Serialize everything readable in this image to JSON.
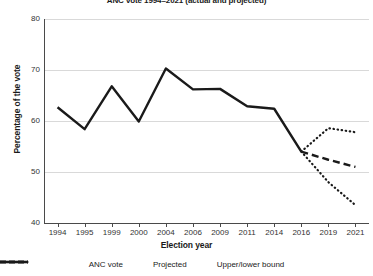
{
  "chart_data": {
    "type": "line",
    "title": "ANC vote 1994–2021 (actual and projected)",
    "xlabel": "Election year",
    "ylabel": "Percentage of the vote",
    "categories": [
      "1994",
      "1995",
      "1999",
      "2000",
      "2004",
      "2006",
      "2009",
      "2011",
      "2014",
      "2016",
      "2019",
      "2021"
    ],
    "ylim": [
      40,
      80
    ],
    "yticks": [
      40,
      50,
      60,
      70,
      80
    ],
    "grid": true,
    "legend_position": "bottom",
    "series": [
      {
        "name": "ANC vote",
        "style": "solid",
        "color": "#1a1a1a",
        "x": [
          "1994",
          "1995",
          "1999",
          "2000",
          "2004",
          "2006",
          "2009",
          "2011",
          "2014",
          "2016"
        ],
        "values": [
          62.7,
          58.4,
          66.8,
          59.9,
          70.3,
          66.2,
          66.3,
          62.9,
          62.4,
          54.0
        ]
      },
      {
        "name": "Projected",
        "style": "dashed",
        "color": "#1a1a1a",
        "x": [
          "2016",
          "2019",
          "2021"
        ],
        "values": [
          54.0,
          52.4,
          51.0
        ]
      },
      {
        "name": "Upper/lower bound",
        "style": "dotted",
        "color": "#1a1a1a",
        "x": [
          "2016",
          "2019",
          "2021"
        ],
        "upper": [
          54.0,
          58.6,
          57.8
        ],
        "lower": [
          54.0,
          48.0,
          43.5
        ]
      }
    ]
  },
  "axis": {
    "y_tick_labels": [
      "80",
      "70",
      "60",
      "50",
      "40"
    ],
    "x_tick_labels": [
      "1994",
      "1995",
      "1999",
      "2000",
      "2004",
      "2006",
      "2009",
      "2011",
      "2014",
      "2016",
      "2019",
      "2021"
    ]
  },
  "legend": {
    "items": [
      {
        "label": "ANC vote",
        "style": "solid"
      },
      {
        "label": "Projected",
        "style": "dashed"
      },
      {
        "label": "Upper/lower bound",
        "style": "dotted"
      }
    ]
  }
}
